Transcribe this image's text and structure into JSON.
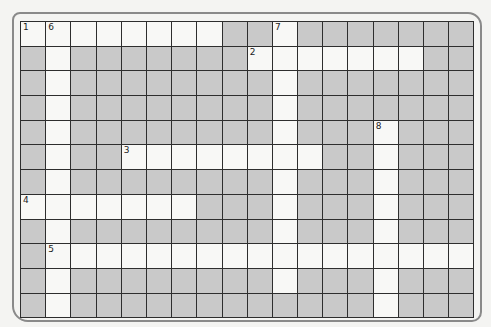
{
  "puzzle": {
    "type": "crossword",
    "cols": 18,
    "rows": 12,
    "colors": {
      "white": "#f8f8f6",
      "block": "#c9c9c9",
      "line": "#2e2e2e"
    },
    "grid": [
      "WWWWWWWW##W#######",
      "#W#######WWWWWWW##",
      "#W########W#######",
      "#W########W#######",
      "#W########W###W###",
      "#W##WWWWWWWW##W###",
      "#W########W###W###",
      "WWWWWWW###W###W###",
      "#W########W###W###",
      "#WWWWWWWWWWWWWWWWW",
      "#W########W###W###",
      "#W############W###"
    ],
    "numbers": [
      {
        "row": 0,
        "col": 0,
        "label": "1"
      },
      {
        "row": 0,
        "col": 1,
        "label": "6"
      },
      {
        "row": 0,
        "col": 10,
        "label": "7"
      },
      {
        "row": 1,
        "col": 9,
        "label": "2"
      },
      {
        "row": 4,
        "col": 14,
        "label": "8"
      },
      {
        "row": 5,
        "col": 4,
        "label": "3"
      },
      {
        "row": 7,
        "col": 0,
        "label": "4"
      },
      {
        "row": 9,
        "col": 1,
        "label": "5"
      }
    ]
  }
}
